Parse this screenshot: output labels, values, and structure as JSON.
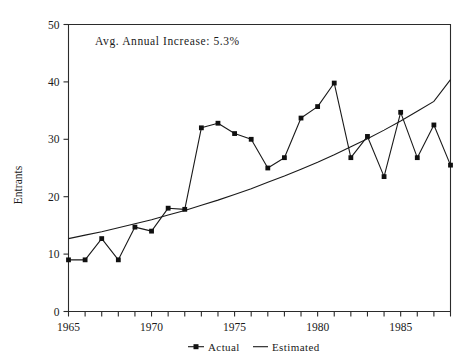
{
  "chart_data": {
    "type": "line",
    "title": "",
    "xlabel": "",
    "ylabel": "Entrants",
    "xlim": [
      1965,
      1988
    ],
    "ylim": [
      0,
      50
    ],
    "yticks": [
      0,
      10,
      20,
      30,
      40,
      50
    ],
    "ytick_labels": [
      "0",
      "10",
      "20",
      "30",
      "40",
      "50"
    ],
    "xticks": [
      1965,
      1966,
      1967,
      1968,
      1969,
      1970,
      1971,
      1972,
      1973,
      1974,
      1975,
      1976,
      1977,
      1978,
      1979,
      1980,
      1981,
      1982,
      1983,
      1984,
      1985,
      1986,
      1987,
      1988
    ],
    "xtick_labels_shown": [
      "1965",
      "1970",
      "1975",
      "1980",
      "1985"
    ],
    "xtick_labels_shown_at": [
      1965,
      1970,
      1975,
      1980,
      1985
    ],
    "grid": false,
    "legend_position": "bottom-center",
    "annotations": [
      {
        "text": "Avg. Annual Increase: 5.3%",
        "x": 1966.6,
        "y": 46.5
      }
    ],
    "x": [
      1965,
      1966,
      1967,
      1968,
      1969,
      1970,
      1971,
      1972,
      1973,
      1974,
      1975,
      1976,
      1977,
      1978,
      1979,
      1980,
      1981,
      1982,
      1983,
      1984,
      1985,
      1986,
      1987,
      1988
    ],
    "series": [
      {
        "name": "Actual",
        "marker": "square",
        "values": [
          9.0,
          9.0,
          12.7,
          9.0,
          14.7,
          14.0,
          18.0,
          17.8,
          32.0,
          32.8,
          31.0,
          30.0,
          25.0,
          26.8,
          33.7,
          35.7,
          39.8,
          26.8,
          30.5,
          23.5,
          34.7,
          26.8,
          32.5,
          25.5
        ]
      },
      {
        "name": "Estimated",
        "marker": "none",
        "values": [
          12.7,
          13.3,
          13.9,
          14.6,
          15.3,
          16.0,
          16.8,
          17.6,
          18.5,
          19.4,
          20.4,
          21.4,
          22.5,
          23.6,
          24.8,
          26.0,
          27.3,
          28.7,
          30.1,
          31.6,
          33.2,
          34.9,
          36.6,
          40.4
        ]
      }
    ],
    "legend": [
      {
        "label": "Actual",
        "marker": "square-with-line"
      },
      {
        "label": "Estimated",
        "marker": "line"
      }
    ],
    "colors": {
      "axis": "#2b2b2b",
      "actual": "#1a1a1a",
      "estimated": "#1a1a1a",
      "background": "#ffffff"
    }
  }
}
